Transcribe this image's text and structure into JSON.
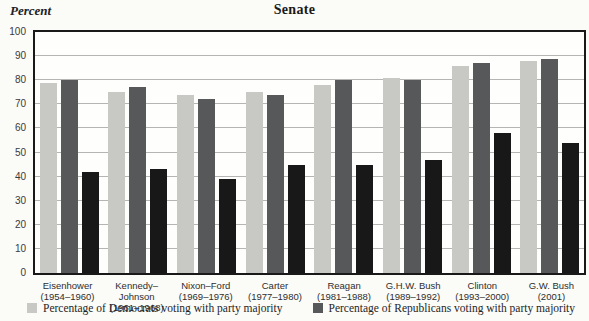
{
  "title": "Senate",
  "y_axis_label": "Percent",
  "colors": {
    "democrat_bar": "#c8c8c5",
    "republican_bar": "#57585a",
    "black_bar": "#181818",
    "gridline": "#b5b5b3",
    "plot_border": "#191919",
    "background": "#fbfbf8"
  },
  "legend": [
    {
      "label": "Percentage of Democrats voting with party majority",
      "color": "#c8c8c5"
    },
    {
      "label": "Percentage of Republicans voting with party majority",
      "color": "#57585a"
    }
  ],
  "chart_data": {
    "type": "bar",
    "title": "Senate",
    "ylabel": "Percent",
    "ylim": [
      0,
      100
    ],
    "ytick_interval": 10,
    "grid": true,
    "legend_position": "bottom",
    "categories": [
      {
        "label": "Eisenhower",
        "years": "(1954–1960)"
      },
      {
        "label": "Kennedy–Johnson",
        "years": "(1961–1968)"
      },
      {
        "label": "Nixon–Ford",
        "years": "(1969–1976)"
      },
      {
        "label": "Carter",
        "years": "(1977–1980)"
      },
      {
        "label": "Reagan",
        "years": "(1981–1988)"
      },
      {
        "label": "G.H.W. Bush",
        "years": "(1989–1992)"
      },
      {
        "label": "Clinton",
        "years": "(1993–2000)"
      },
      {
        "label": "G.W. Bush",
        "years": "(2001)"
      }
    ],
    "series": [
      {
        "name": "Percentage of Democrats voting with party majority",
        "color": "#c8c8c5",
        "values": [
          79,
          75,
          74,
          75,
          78,
          81,
          86,
          88
        ]
      },
      {
        "name": "Percentage of Republicans voting with party majority",
        "color": "#57585a",
        "values": [
          80,
          77,
          72,
          74,
          80,
          80,
          87,
          89
        ]
      },
      {
        "name": "unlabeled-black-series",
        "color": "#181818",
        "values": [
          42,
          43,
          39,
          45,
          45,
          47,
          58,
          54
        ]
      }
    ]
  }
}
